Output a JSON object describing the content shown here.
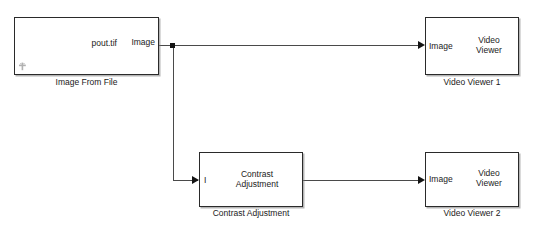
{
  "diagram": {
    "blocks": [
      {
        "id": "image-from-file",
        "caption": "Image From File",
        "inner_label": "pout.tif",
        "output_port_label": "Image",
        "corner_icon": "anchor-glyph-icon"
      },
      {
        "id": "video-viewer-1",
        "caption": "Video Viewer 1",
        "inner_label": "Video\nViewer",
        "input_port_label": "Image"
      },
      {
        "id": "contrast-adjustment",
        "caption": "Contrast Adjustment",
        "inner_label": "Contrast\nAdjustment",
        "input_port_label": "I"
      },
      {
        "id": "video-viewer-2",
        "caption": "Video Viewer 2",
        "inner_label": "Video\nViewer",
        "input_port_label": "Image"
      }
    ],
    "colors": {
      "background": "#ffffff",
      "block_border": "#2a2a2a",
      "block_fill": "#ffffff",
      "wire": "#4a4a4a",
      "arrow": "#141414",
      "text": "#1a1a1a",
      "shadow": "#787878"
    }
  }
}
